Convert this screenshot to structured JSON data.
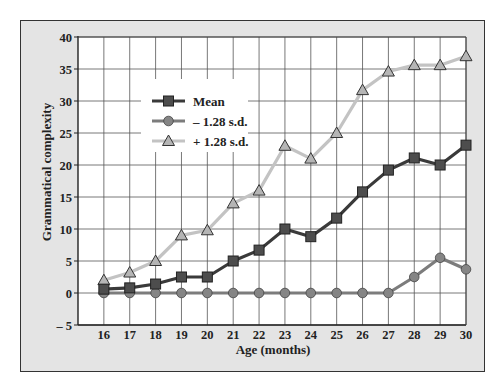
{
  "chart_data": {
    "type": "line",
    "title": "",
    "xlabel": "Age (months)",
    "ylabel": "Grammatical complexity",
    "x": [
      16,
      17,
      18,
      19,
      20,
      21,
      22,
      23,
      24,
      25,
      26,
      27,
      28,
      29,
      30
    ],
    "xticks": [
      "16",
      "17",
      "18",
      "19",
      "20",
      "21",
      "22",
      "23",
      "24",
      "25",
      "26",
      "27",
      "28",
      "29",
      "30"
    ],
    "yticks": [
      "40",
      "35",
      "30",
      "25",
      "20",
      "15",
      "10",
      "5",
      "0",
      "– 5"
    ],
    "ylim": [
      -5,
      40
    ],
    "xlim": [
      15,
      30
    ],
    "grid": true,
    "legend_position": "upper-left-inset",
    "series": [
      {
        "name": "Mean",
        "marker": "square",
        "line_color": "#3a3a3a",
        "marker_color": "#4d4d4d",
        "values": [
          0.6,
          0.8,
          1.4,
          2.5,
          2.5,
          5.0,
          6.7,
          10.0,
          8.8,
          11.7,
          15.8,
          19.2,
          21.1,
          20.0,
          23.1
        ]
      },
      {
        "name": "– 1.28 s.d.",
        "marker": "circle",
        "line_color": "#7c7c7c",
        "marker_color": "#858585",
        "values": [
          0,
          0,
          0,
          0,
          0,
          0,
          0,
          0,
          0,
          0,
          0,
          0,
          2.5,
          5.5,
          3.7
        ]
      },
      {
        "name": "+ 1.28 s.d.",
        "marker": "triangle",
        "line_color": "#c3c3c3",
        "marker_color": "#b5b5b5",
        "values": [
          2.0,
          3.2,
          5.0,
          9.0,
          9.8,
          14.0,
          16.0,
          23.0,
          21.0,
          25.0,
          31.7,
          34.6,
          35.6,
          35.6,
          37.0
        ]
      }
    ]
  },
  "colors": {
    "frame_bg": "#e4e4e4",
    "plot_bg": "#ffffff",
    "grid": "#555555"
  }
}
